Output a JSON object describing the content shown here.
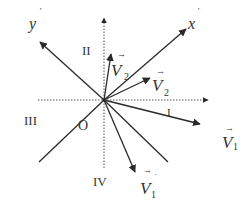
{
  "diagram": {
    "title": "",
    "origin_label": "O",
    "axes": {
      "x_axis_label": "x",
      "x_axis_prime": "'",
      "y_axis_label": "y",
      "y_axis_prime": "'"
    },
    "quadrants": {
      "q1": "I",
      "q2": "II",
      "q3": "III",
      "q4": "IV"
    },
    "vectors": {
      "v1": {
        "symbol": "V",
        "subscript": "1",
        "arrow": "→"
      },
      "v1_prime": {
        "symbol": "V",
        "subscript": "1",
        "arrow": "→",
        "prime": "'"
      },
      "v2": {
        "symbol": "V",
        "subscript": "2",
        "arrow": "→"
      },
      "v2_prime": {
        "symbol": "V",
        "subscript": "2",
        "arrow": "→",
        "prime": "'"
      }
    },
    "colors": {
      "line": "#2a2a2a",
      "dotted": "#555555",
      "text": "#333333",
      "background": "#ffffff"
    }
  }
}
